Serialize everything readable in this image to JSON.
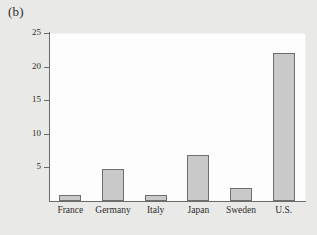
{
  "panel": {
    "label": "(b)"
  },
  "chart_data": {
    "type": "bar",
    "title": "",
    "subtitle": "",
    "xlabel": "",
    "ylabel": "",
    "categories": [
      "France",
      "Germany",
      "Italy",
      "Japan",
      "Sweden",
      "U.S."
    ],
    "values": [
      0.9,
      4.7,
      0.9,
      6.8,
      2.0,
      22.0
    ],
    "ylim": [
      0,
      25
    ],
    "yticks": [
      5,
      10,
      15,
      20,
      25
    ],
    "ytick_labels": [
      "5",
      "10",
      "15",
      "20",
      "25"
    ],
    "grid": false,
    "legend": false,
    "legend_position": "none",
    "bar_fill": "#c9c9c9",
    "bar_edge": "#6e6e6e",
    "plot_background": "#fdfdfd",
    "page_background": "#e9e9e7",
    "axis_color": "#6b6b6b",
    "text_color": "#2b2b2b"
  }
}
